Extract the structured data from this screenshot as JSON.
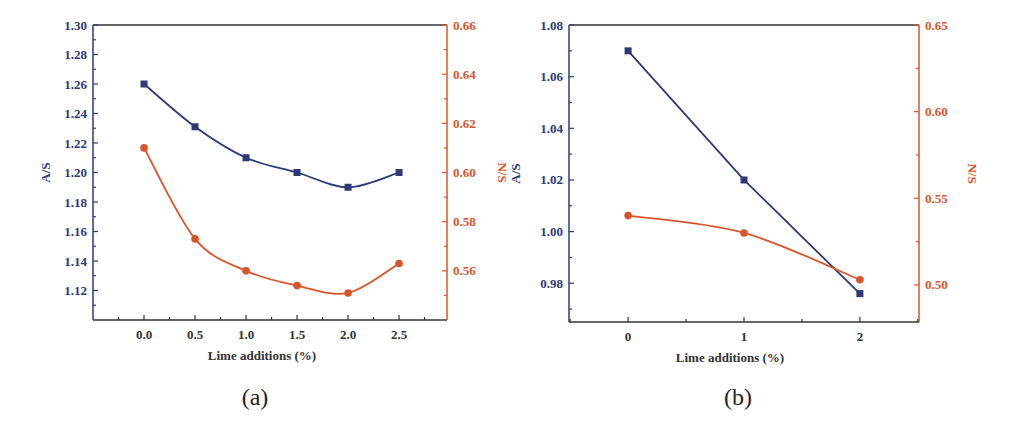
{
  "colors": {
    "as_series": "#2e3a78",
    "ns_series": "#d9542b",
    "axis": "#333333"
  },
  "chart_data": [
    {
      "type": "line",
      "panel": "(a)",
      "title": "",
      "xlabel": "Lime additions (%)",
      "ylabel": "A/S",
      "ylabel_right": "N/S",
      "x": [
        0.0,
        0.5,
        1.0,
        1.5,
        2.0,
        2.5
      ],
      "xticks": [
        "0.0",
        "0.5",
        "1.0",
        "1.5",
        "2.0",
        "2.5"
      ],
      "xlim": [
        -0.5,
        2.97
      ],
      "ylim": [
        1.1,
        1.3
      ],
      "yticks": [
        "1.12",
        "1.14",
        "1.16",
        "1.18",
        "1.20",
        "1.22",
        "1.24",
        "1.26",
        "1.28",
        "1.30"
      ],
      "ylim_right": [
        0.54,
        0.66
      ],
      "yticks_right": [
        "0.56",
        "0.58",
        "0.60",
        "0.62",
        "0.64",
        "0.66"
      ],
      "grid": false,
      "series": [
        {
          "name": "A/S",
          "axis": "left",
          "marker": "square",
          "fit": "smooth",
          "values": [
            1.26,
            1.231,
            1.21,
            1.2,
            1.19,
            1.2
          ]
        },
        {
          "name": "N/S",
          "axis": "right",
          "marker": "circle",
          "fit": "smooth",
          "values": [
            0.61,
            0.573,
            0.56,
            0.554,
            0.551,
            0.563
          ]
        }
      ]
    },
    {
      "type": "line",
      "panel": "(b)",
      "title": "",
      "xlabel": "Lime additions (%)",
      "ylabel": "A/S",
      "ylabel_right": "N/S",
      "x": [
        0,
        1,
        2
      ],
      "xticks": [
        "0",
        "1",
        "2"
      ],
      "xlim": [
        -0.51,
        2.51
      ],
      "ylim": [
        0.965,
        1.08
      ],
      "yticks": [
        "0.98",
        "1.00",
        "1.02",
        "1.04",
        "1.06",
        "1.08"
      ],
      "ylim_right": [
        0.4786,
        0.65
      ],
      "yticks_right": [
        "0.50",
        "0.55",
        "0.60",
        "0.65"
      ],
      "grid": false,
      "series": [
        {
          "name": "A/S",
          "axis": "left",
          "marker": "square",
          "fit": "linear",
          "values": [
            1.07,
            1.02,
            0.976
          ]
        },
        {
          "name": "N/S",
          "axis": "right",
          "marker": "circle",
          "fit": "smooth",
          "values": [
            0.54,
            0.53,
            0.503
          ]
        }
      ]
    }
  ]
}
